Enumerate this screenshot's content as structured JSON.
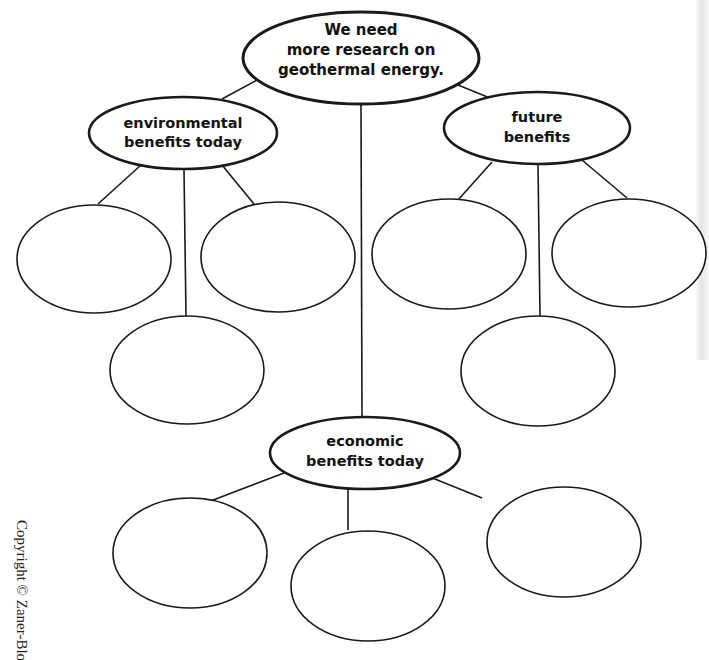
{
  "diagram": {
    "type": "web graphic organizer",
    "colors": {
      "stroke": "#1a1a1a",
      "background": "#ffffff",
      "text": "#111111"
    },
    "main_idea": {
      "lines": [
        "We need",
        "more research on",
        "geothermal energy."
      ]
    },
    "categories": [
      {
        "id": "env",
        "lines": [
          "environmental",
          "benefits today"
        ],
        "blank_circles": 3
      },
      {
        "id": "future",
        "lines": [
          "future",
          "benefits"
        ],
        "blank_circles": 3
      },
      {
        "id": "econ",
        "lines": [
          "economic",
          "benefits today"
        ],
        "blank_circles": 3
      }
    ]
  },
  "footer": {
    "copyright": "Copyright © Zaner-Bloser, Inc."
  }
}
